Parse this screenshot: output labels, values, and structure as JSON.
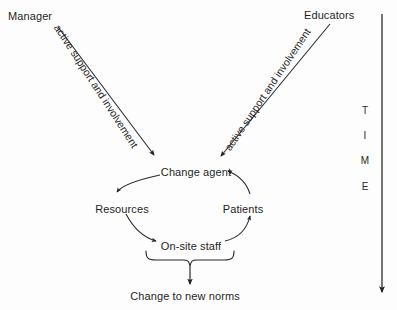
{
  "diagram": {
    "type": "flow-cycle",
    "sources": [
      {
        "id": "manager",
        "label": "Manager",
        "x": 8,
        "y": 10
      },
      {
        "id": "educators",
        "label": "Educators",
        "x": 333,
        "y": 10
      }
    ],
    "edge_captions": [
      {
        "id": "left-edge-caption",
        "label": "active support and involvement",
        "from": "manager",
        "to": "change-agent"
      },
      {
        "id": "right-edge-caption",
        "label": "active support and involvement",
        "from": "educators",
        "to": "change-agent"
      }
    ],
    "cycle_nodes": [
      {
        "id": "change-agent",
        "label": "Change agent",
        "x": 196,
        "y": 166
      },
      {
        "id": "resources",
        "label": "Resources",
        "x": 122,
        "y": 203
      },
      {
        "id": "patients",
        "label": "Patients",
        "x": 243,
        "y": 203
      },
      {
        "id": "on-site-staff",
        "label": "On-site staff",
        "x": 191,
        "y": 240
      }
    ],
    "cycle_order": [
      "change-agent",
      "resources",
      "on-site-staff",
      "patients",
      "change-agent"
    ],
    "outcome": {
      "id": "change-to-new-norms",
      "label": "Change to new norms",
      "x": 185,
      "y": 290
    },
    "time_axis": {
      "id": "time-axis",
      "letters": [
        "T",
        "I",
        "M",
        "E"
      ],
      "direction": "downward",
      "line_x": 382,
      "line_top": 14,
      "line_bottom": 297
    },
    "colors": {
      "ink": "#1f1f1f",
      "stroke": "#2b2b2b",
      "background": "#fdfdfd"
    }
  }
}
